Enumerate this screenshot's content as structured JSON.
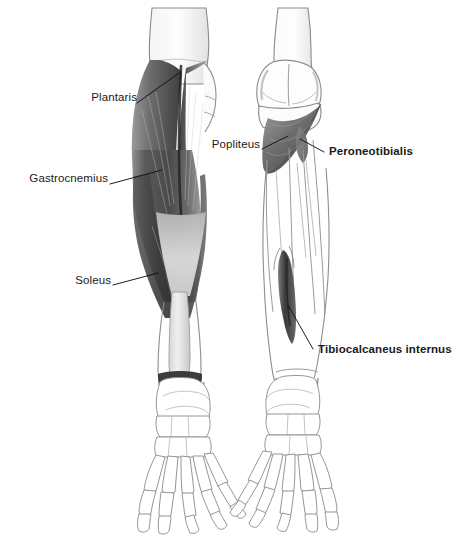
{
  "figure": {
    "background_color": "#ffffff",
    "width": 456,
    "height": 544,
    "ink_color": "#1a1a1a",
    "leader_line_color": "#111111",
    "outline_color": "#6b6b6b"
  },
  "labels": [
    {
      "id": "plantaris",
      "text": "Plantaris",
      "bold": false,
      "x": 76,
      "y": 98,
      "anchor": "right",
      "leader": {
        "x1": 137,
        "y1": 103,
        "x2": 179,
        "y2": 73
      }
    },
    {
      "id": "gastrocnemius",
      "text": "Gastrocnemius",
      "bold": false,
      "x": 23,
      "y": 179,
      "anchor": "right",
      "leader": {
        "x1": 110,
        "y1": 184,
        "x2": 162,
        "y2": 170
      }
    },
    {
      "id": "soleus",
      "text": "Soleus",
      "bold": false,
      "x": 73,
      "y": 281,
      "anchor": "right",
      "leader": {
        "x1": 113,
        "y1": 285,
        "x2": 158,
        "y2": 273
      }
    },
    {
      "id": "popliteus",
      "text": "Popliteus",
      "bold": false,
      "x": 208,
      "y": 145,
      "anchor": "right",
      "leader": {
        "x1": 262,
        "y1": 149,
        "x2": 288,
        "y2": 136
      }
    },
    {
      "id": "peroneotibialis",
      "text": "Peroneotibialis",
      "bold": true,
      "x": 329,
      "y": 152,
      "anchor": "left",
      "leader": {
        "x1": 324,
        "y1": 152,
        "x2": 300,
        "y2": 139
      }
    },
    {
      "id": "tibiocalcaneus-internus",
      "text": "Tibiocalcaneus internus",
      "bold": true,
      "x": 318,
      "y": 350,
      "anchor": "left",
      "leader": {
        "x1": 313,
        "y1": 349,
        "x2": 288,
        "y2": 305
      }
    }
  ],
  "views": [
    {
      "id": "left-view",
      "name": "superficial-posterior-leg",
      "side": "left",
      "structures": [
        "gastrocnemius medial head",
        "gastrocnemius lateral head",
        "plantaris",
        "soleus",
        "achilles tendon",
        "tarsal bones",
        "metatarsal bones",
        "phalanges"
      ]
    },
    {
      "id": "right-view",
      "name": "deep-posterior-leg",
      "side": "right",
      "structures": [
        "distal femur",
        "femoral condyles",
        "tibial plateau",
        "popliteus",
        "peroneotibialis",
        "tibiocalcaneus internus",
        "tibia",
        "fibula",
        "tarsal bones",
        "metatarsal bones",
        "phalanges"
      ]
    }
  ]
}
